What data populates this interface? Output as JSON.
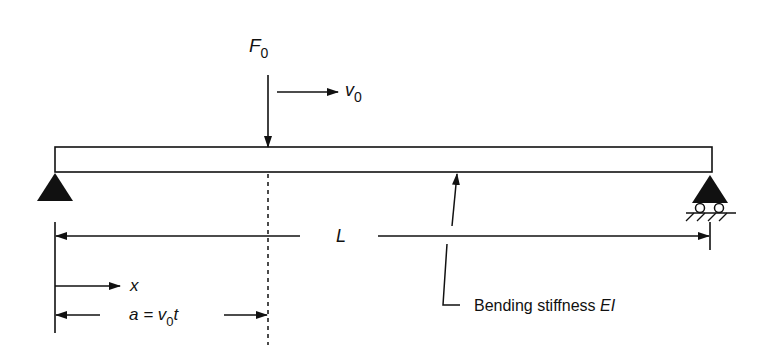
{
  "diagram": {
    "colors": {
      "ink": "#111111",
      "background": "#ffffff"
    },
    "load": {
      "symbol": "F",
      "subscript": "0"
    },
    "velocity": {
      "symbol": "v",
      "subscript": "0"
    },
    "span": {
      "label": "L"
    },
    "coordinate": {
      "label": "x"
    },
    "position": {
      "prefix": "a = v",
      "subscript": "0",
      "suffix": "t"
    },
    "stiffness": {
      "text": "Bending stiffness ",
      "symbol": "EI"
    },
    "supports": [
      {
        "type": "pinned",
        "location": "left"
      },
      {
        "type": "roller",
        "location": "right"
      }
    ]
  }
}
